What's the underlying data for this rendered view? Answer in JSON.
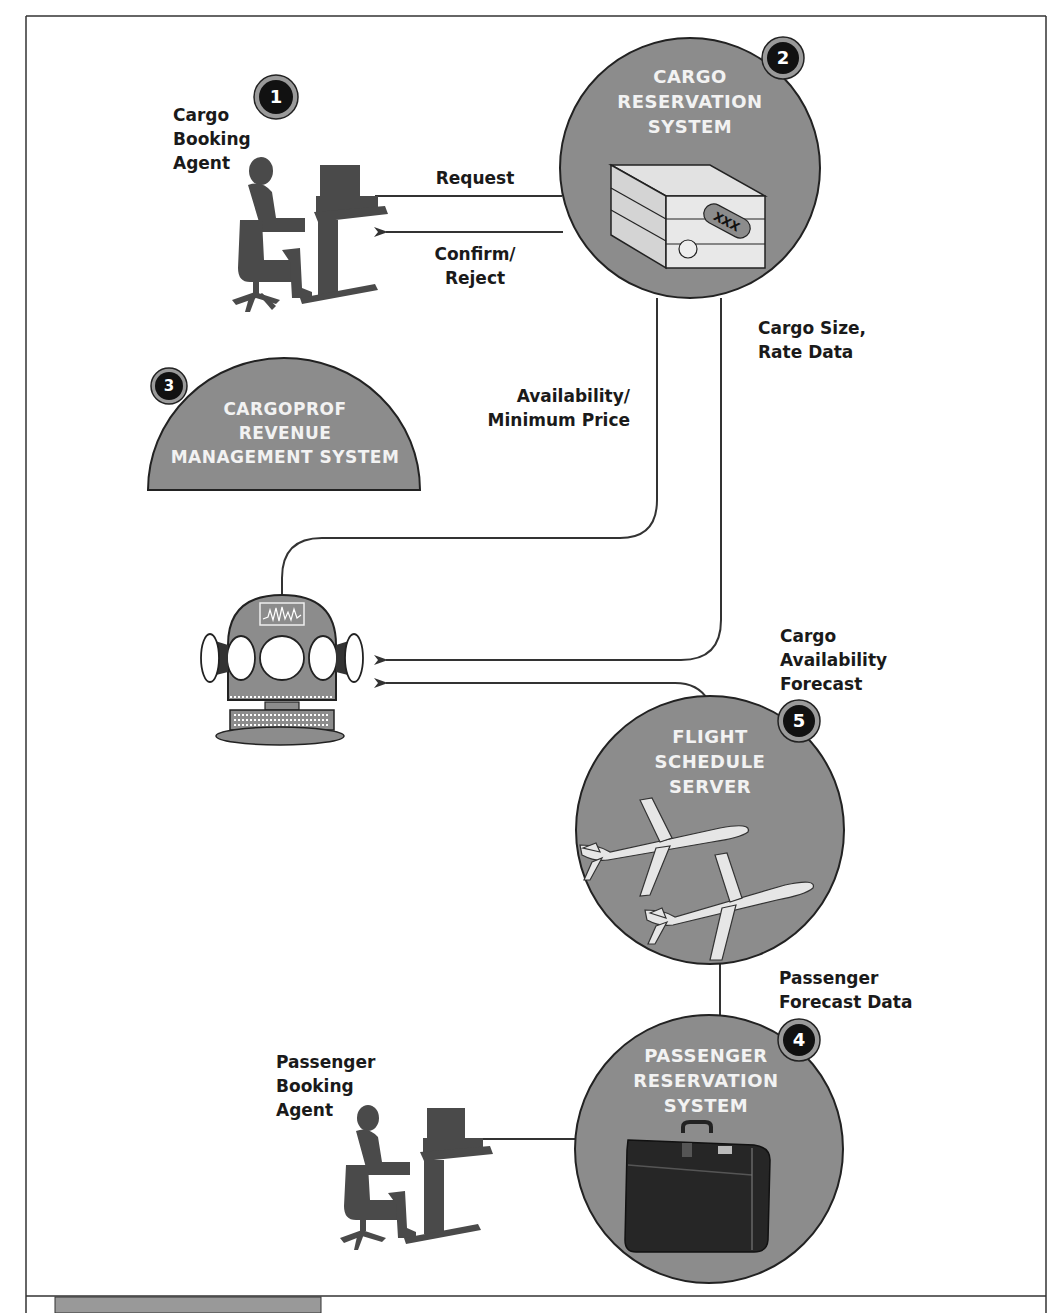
{
  "diagram": {
    "nodes": [
      {
        "id": 1,
        "badge": "1",
        "type": "agent",
        "label": "Cargo\nBooking\nAgent"
      },
      {
        "id": 2,
        "badge": "2",
        "type": "system",
        "title": "CARGO\nRESERVATION\nSYSTEM",
        "icon": "server-box-icon",
        "icon_text": "XXX"
      },
      {
        "id": 3,
        "badge": "3",
        "type": "system",
        "title": "CARGOPROF\nREVENUE\nMANAGEMENT SYSTEM"
      },
      {
        "id": 4,
        "badge": "4",
        "type": "system",
        "title": "PASSENGER\nRESERVATION\nSYSTEM",
        "icon": "suitcase-icon"
      },
      {
        "id": 5,
        "badge": "5",
        "type": "system",
        "title": "FLIGHT\nSCHEDULE\nSERVER",
        "icon": "airplanes-icon"
      },
      {
        "id": 6,
        "type": "agent",
        "label": "Passenger\nBooking\nAgent"
      },
      {
        "id": 7,
        "type": "engine",
        "icon": "forecast-robot-icon"
      }
    ],
    "edges": [
      {
        "from": "Cargo Booking Agent",
        "to": "Cargo Reservation System",
        "label": "Request"
      },
      {
        "from": "Cargo Reservation System",
        "to": "Cargo Booking Agent",
        "label": "Confirm/\nReject"
      },
      {
        "from": "Forecast Engine",
        "to": "Cargo Reservation System",
        "label": "Availability/\nMinimum Price"
      },
      {
        "from": "Cargo Reservation System",
        "to": "Forecast Engine",
        "label": "Cargo Size,\nRate Data"
      },
      {
        "from": "Flight Schedule Server",
        "to": "Forecast Engine",
        "label": "Cargo\nAvailability\nForecast"
      },
      {
        "from": "Passenger Reservation System",
        "to": "Flight Schedule Server",
        "label": "Passenger\nForecast Data"
      },
      {
        "from": "Passenger Booking Agent",
        "to": "Passenger Reservation System",
        "label": ""
      }
    ]
  },
  "colors": {
    "node_fill": "#8c8c8c",
    "badge_fill": "#111111",
    "badge_ring": "#9a9a9a",
    "line": "#333333",
    "text": "#1a1a1a",
    "node_text": "#f2f2f2",
    "silhouette": "#4a4a4a"
  }
}
